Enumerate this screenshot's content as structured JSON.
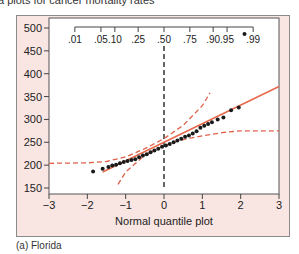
{
  "header": {
    "caption": "a plots for cancer mortality rates"
  },
  "footer": {
    "caption": "(a) Florida"
  },
  "colors": {
    "frame_bg": "#f9e6e2",
    "plot_bg": "#ffffff",
    "fit_line": "#e8664a",
    "band": "#e0604a",
    "points": "#1a1a1a",
    "median_line": "#333333"
  },
  "chart_data": {
    "type": "scatter",
    "title": "",
    "xlabel": "Normal quantile plot",
    "ylabel": "",
    "xlim": [
      -3,
      3
    ],
    "ylim": [
      150,
      500
    ],
    "x_ticks": [
      "-3",
      "-2",
      "-1",
      "0",
      "1",
      "2",
      "3"
    ],
    "y_ticks": [
      "150",
      "200",
      "250",
      "300",
      "350",
      "400",
      "450",
      "500"
    ],
    "top_axis_ticks": [
      ".01",
      ".05",
      ".10",
      ".25",
      ".50",
      ".75",
      ".90",
      ".95",
      ".99"
    ],
    "top_axis_z": [
      -2.326,
      -1.645,
      -1.282,
      -0.674,
      0,
      0.674,
      1.282,
      1.645,
      2.326
    ],
    "grid": false,
    "points": [
      {
        "x": -1.85,
        "y": 186
      },
      {
        "x": -1.6,
        "y": 192
      },
      {
        "x": -1.45,
        "y": 196
      },
      {
        "x": -1.35,
        "y": 199
      },
      {
        "x": -1.25,
        "y": 201
      },
      {
        "x": -1.15,
        "y": 204
      },
      {
        "x": -1.05,
        "y": 207
      },
      {
        "x": -0.95,
        "y": 209
      },
      {
        "x": -0.85,
        "y": 211
      },
      {
        "x": -0.75,
        "y": 213
      },
      {
        "x": -0.65,
        "y": 217
      },
      {
        "x": -0.55,
        "y": 221
      },
      {
        "x": -0.45,
        "y": 224
      },
      {
        "x": -0.35,
        "y": 228
      },
      {
        "x": -0.25,
        "y": 232
      },
      {
        "x": -0.15,
        "y": 236
      },
      {
        "x": -0.05,
        "y": 240
      },
      {
        "x": 0.05,
        "y": 243
      },
      {
        "x": 0.15,
        "y": 246
      },
      {
        "x": 0.25,
        "y": 250
      },
      {
        "x": 0.35,
        "y": 254
      },
      {
        "x": 0.45,
        "y": 258
      },
      {
        "x": 0.55,
        "y": 262
      },
      {
        "x": 0.65,
        "y": 265
      },
      {
        "x": 0.75,
        "y": 269
      },
      {
        "x": 0.85,
        "y": 274
      },
      {
        "x": 0.95,
        "y": 282
      },
      {
        "x": 1.05,
        "y": 286
      },
      {
        "x": 1.15,
        "y": 290
      },
      {
        "x": 1.25,
        "y": 294
      },
      {
        "x": 1.4,
        "y": 300
      },
      {
        "x": 1.55,
        "y": 304
      },
      {
        "x": 1.75,
        "y": 320
      },
      {
        "x": 1.95,
        "y": 326
      },
      {
        "x": 2.1,
        "y": 487
      }
    ],
    "fit_line": {
      "x": [
        -1.6,
        3.0
      ],
      "y": [
        185,
        372
      ]
    },
    "confidence_band_upper": {
      "x": [
        -3,
        -2,
        -1.5,
        -1.0,
        -0.5,
        0,
        0.5,
        1.0,
        1.2
      ],
      "y": [
        204,
        205,
        208,
        218,
        236,
        258,
        287,
        330,
        358
      ]
    },
    "confidence_band_lower": {
      "x": [
        -1.2,
        -1.0,
        -0.5,
        0,
        0.5,
        1.0,
        1.5,
        2.0,
        3.0
      ],
      "y": [
        158,
        185,
        222,
        243,
        256,
        264,
        271,
        275,
        275
      ]
    },
    "median_line_x": 0
  }
}
